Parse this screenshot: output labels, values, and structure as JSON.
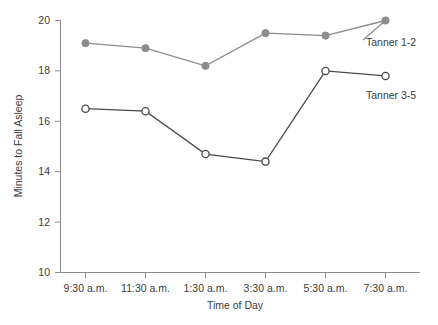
{
  "chart_data": {
    "type": "line",
    "title": "",
    "xlabel": "Time of Day",
    "ylabel": "Minutes to Fall Asleep",
    "categories": [
      "9:30 a.m.",
      "11:30 a.m.",
      "1:30 a.m.",
      "3:30 a.m.",
      "5:30 a.m.",
      "7:30 a.m."
    ],
    "ylim": [
      10,
      20
    ],
    "yticks": [
      10,
      12,
      14,
      16,
      18,
      20
    ],
    "ytick_labels": [
      "10",
      "12",
      "14",
      "16",
      "18",
      "20"
    ],
    "grid": false,
    "legend_position": "inline-right",
    "series": [
      {
        "name": "Tanner 1-2",
        "marker": "filled-circle",
        "color": "#8c8c8c",
        "values": [
          19.1,
          18.9,
          18.2,
          19.5,
          19.4,
          20.0
        ]
      },
      {
        "name": "Tanner 3-5",
        "marker": "open-circle",
        "color": "#4a4a4a",
        "values": [
          16.5,
          16.4,
          14.7,
          14.4,
          18.0,
          17.8
        ]
      }
    ]
  },
  "axis": {
    "y_title": "Minutes to Fall Asleep",
    "x_title": "Time of Day"
  },
  "labels": {
    "series_a": "Tanner 1-2",
    "series_b": "Tanner 3-5",
    "ytick_0": "10",
    "ytick_1": "12",
    "ytick_2": "14",
    "ytick_3": "16",
    "ytick_4": "18",
    "ytick_5": "20",
    "xtick_0": "9:30 a.m.",
    "xtick_1": "11:30 a.m.",
    "xtick_2": "1:30 a.m.",
    "xtick_3": "3:30 a.m.",
    "xtick_4": "5:30 a.m.",
    "xtick_5": "7:30 a.m."
  }
}
